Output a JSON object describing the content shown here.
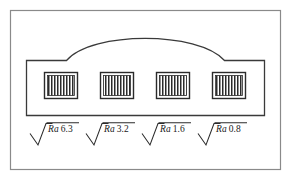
{
  "figure": {
    "width": 291,
    "height": 181,
    "background_color": "#ffffff",
    "line_color": "#3a3a3a",
    "frame": {
      "x": 10,
      "y": 10,
      "width": 271,
      "height": 160,
      "stroke": "#808080"
    }
  },
  "part": {
    "name": "arched-block-part",
    "outline_color": "#3a3a3a",
    "body": {
      "left": 26,
      "right": 265,
      "bottom": 115,
      "shoulder_y": 60
    },
    "arch": {
      "left_x": 66,
      "right_x": 225,
      "apex_x": 145,
      "apex_y": 24
    }
  },
  "surface_patches": [
    {
      "id": "patch-1",
      "x": 44,
      "y": 72,
      "width": 34,
      "height": 27,
      "hatch_lines": 11
    },
    {
      "id": "patch-2",
      "x": 100,
      "y": 72,
      "width": 34,
      "height": 27,
      "hatch_lines": 11
    },
    {
      "id": "patch-3",
      "x": 156,
      "y": 72,
      "width": 34,
      "height": 27,
      "hatch_lines": 11
    },
    {
      "id": "patch-4",
      "x": 212,
      "y": 72,
      "width": 34,
      "height": 27,
      "hatch_lines": 11
    }
  ],
  "roughness_symbols": [
    {
      "id": "symbol-ra-6-3",
      "parameter": "Ra",
      "value": "6.3",
      "label": "Ra 6.3",
      "unit": "micrometres",
      "x": 30,
      "y": 123,
      "label_x": 46,
      "label_y": 122
    },
    {
      "id": "symbol-ra-3-2",
      "parameter": "Ra",
      "value": "3.2",
      "label": "Ra 3.2",
      "unit": "micrometres",
      "x": 86,
      "y": 123,
      "label_x": 102,
      "label_y": 122
    },
    {
      "id": "symbol-ra-1-6",
      "parameter": "Ra",
      "value": "1.6",
      "label": "Ra 1.6",
      "unit": "micrometres",
      "x": 142,
      "y": 123,
      "label_x": 158,
      "label_y": 122
    },
    {
      "id": "symbol-ra-0-8",
      "parameter": "Ra",
      "value": "0.8",
      "label": "Ra 0.8",
      "unit": "micrometres",
      "x": 198,
      "y": 123,
      "label_x": 214,
      "label_y": 122
    }
  ],
  "labels": {
    "ra_prefix": "Ra",
    "value_1": "6.3",
    "value_2": "3.2",
    "value_3": "1.6",
    "value_4": "0.8"
  }
}
